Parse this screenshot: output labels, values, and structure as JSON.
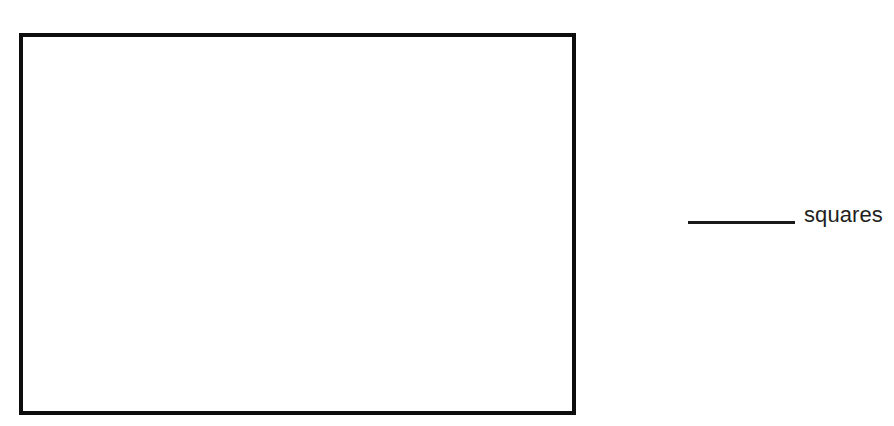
{
  "page": {
    "type": "worksheet-figure",
    "background_color": "#ffffff",
    "width": 894,
    "height": 426
  },
  "figure": {
    "shape_name": "rectangle",
    "outline_color": "#0d0d0d",
    "fill_color": "#ffffff",
    "border_width_px": 4,
    "interior_text": ""
  },
  "answer_prompt": {
    "blank_label": "",
    "blank_line_color": "#1a1a1a",
    "unit_label": "squares",
    "text_color": "#231f20"
  }
}
